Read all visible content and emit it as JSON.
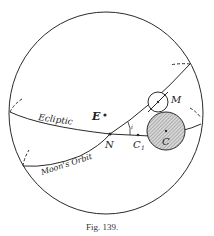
{
  "figure": {
    "caption": "Fig. 139.",
    "labels": {
      "earth": "E",
      "moon": "M",
      "node": "N",
      "c1": "C",
      "c1_sub": "1",
      "shadow": "C",
      "inclination": "i",
      "ecliptic": "Ecliptic",
      "moon_orbit": "Moon's Orbit"
    },
    "colors": {
      "ink": "#2a2a2a",
      "shadow_fill": "#bdbdbd"
    }
  }
}
